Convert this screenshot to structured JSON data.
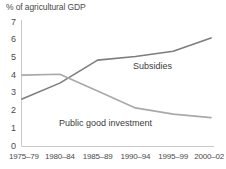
{
  "chart_data": {
    "type": "line",
    "title": "% of agricultural GDP",
    "xlabel": "",
    "ylabel": "% of agricultural GDP",
    "categories": [
      "1975–79",
      "1980–84",
      "1985–89",
      "1990–94",
      "1995–99",
      "2000–02"
    ],
    "yticks": [
      "0",
      "1",
      "2",
      "3",
      "4",
      "5",
      "6",
      "7"
    ],
    "ylim": [
      0,
      7
    ],
    "grid": false,
    "legend": "inline-labels",
    "series": [
      {
        "name": "Subsidies",
        "color": "#7d7d7d",
        "values": [
          2.65,
          3.55,
          4.85,
          5.05,
          5.35,
          6.1
        ]
      },
      {
        "name": "Public good investment",
        "color": "#a9a9a9",
        "values": [
          4.0,
          4.05,
          3.1,
          2.15,
          1.8,
          1.6
        ]
      }
    ],
    "annotations": [
      {
        "text": "Subsidies",
        "series": "Subsidies"
      },
      {
        "text": "Public good investment",
        "series": "Public good investment"
      }
    ],
    "axis_color": "#c8c8c8"
  }
}
